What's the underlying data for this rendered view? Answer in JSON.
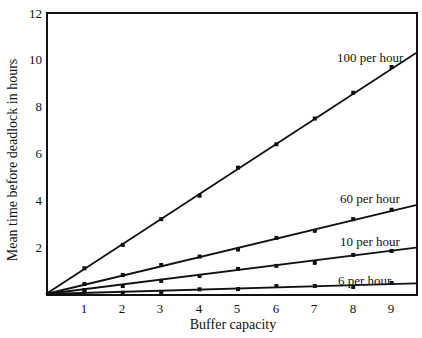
{
  "chart_data": {
    "type": "line",
    "title": "",
    "xlabel": "Buffer capacity",
    "ylabel": "Mean time before deadlock in hours",
    "x_ticks": [
      1,
      2,
      3,
      4,
      5,
      6,
      7,
      8,
      9
    ],
    "y_ticks": [
      2,
      4,
      6,
      8,
      10,
      12
    ],
    "xlim": [
      0,
      9.67
    ],
    "ylim": [
      0,
      12
    ],
    "grid": false,
    "legend": "inline labels at right end of each line",
    "x": [
      1,
      2,
      3,
      4,
      5,
      6,
      7,
      8,
      9
    ],
    "series": [
      {
        "name": "100 per hour",
        "points": [
          1.1,
          2.1,
          3.2,
          4.2,
          5.4,
          6.4,
          7.5,
          8.6,
          9.7
        ],
        "fit_line": {
          "x0": 0,
          "y0": 0,
          "x1": 9.67,
          "y1": 10.3
        }
      },
      {
        "name": "60 per hour",
        "points": [
          0.43,
          0.81,
          1.24,
          1.6,
          1.9,
          2.4,
          2.7,
          3.2,
          3.6
        ],
        "fit_line": {
          "x0": 0,
          "y0": 0,
          "x1": 9.67,
          "y1": 3.8
        }
      },
      {
        "name": "10 per hour",
        "points": [
          0.17,
          0.34,
          0.56,
          0.77,
          1.07,
          1.2,
          1.33,
          1.67,
          1.84
        ],
        "fit_line": {
          "x0": 0,
          "y0": 0,
          "x1": 9.67,
          "y1": 1.98
        }
      },
      {
        "name": "6 per hour",
        "points": [
          0.1,
          0.05,
          0.04,
          0.2,
          0.21,
          0.34,
          0.34,
          0.3,
          0.47
        ],
        "fit_line": {
          "x0": 0,
          "y0": 0,
          "x1": 9.67,
          "y1": 0.45
        }
      }
    ],
    "annotations": [
      {
        "text": "100 per hour",
        "near_x": 9.2,
        "near_y": 10.0
      },
      {
        "text": "60 per hour",
        "near_x": 9.2,
        "near_y": 4.0
      },
      {
        "text": "10 per hour",
        "near_x": 9.2,
        "near_y": 2.1
      },
      {
        "text": "6 per hour",
        "near_x": 9.2,
        "near_y": 0.5
      }
    ]
  },
  "labels": {
    "xlabel": "Buffer capacity",
    "ylabel": "Mean time before deadlock in hours",
    "series_100": "100 per hour",
    "series_60": "60 per hour",
    "series_10": "10 per hour",
    "series_6": "6 per hour",
    "x_tick_labels": [
      "1",
      "2",
      "3",
      "4",
      "5",
      "6",
      "7",
      "8",
      "9"
    ],
    "y_tick_labels": [
      "2",
      "4",
      "6",
      "8",
      "10",
      "12"
    ]
  },
  "colors": {
    "ink": "#111111",
    "background": "#ffffff"
  }
}
